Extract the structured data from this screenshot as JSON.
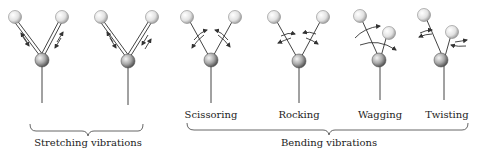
{
  "figure": {
    "groups": [
      {
        "id": "stretching",
        "label": "Stretching vibrations"
      },
      {
        "id": "bending",
        "label": "Bending vibrations"
      }
    ],
    "modes": [
      {
        "id": "sym-stretch",
        "label": ""
      },
      {
        "id": "asym-stretch",
        "label": ""
      },
      {
        "id": "scissoring",
        "label": "Scissoring"
      },
      {
        "id": "rocking",
        "label": "Rocking"
      },
      {
        "id": "wagging",
        "label": "Wagging"
      },
      {
        "id": "twisting",
        "label": "Twisting"
      }
    ],
    "colors": {
      "background": "#ffffff",
      "line": "#444444",
      "text": "#222222"
    }
  }
}
